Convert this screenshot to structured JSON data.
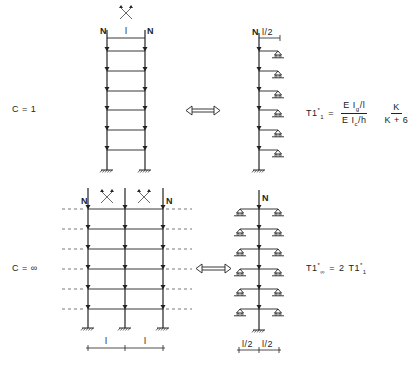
{
  "figure": {
    "top_case": {
      "condition_label": "C = 1",
      "frame_labels": {
        "load_left": "N",
        "load_right": "N",
        "span": "l"
      },
      "substitute_labels": {
        "load": "N",
        "half_span": "l/2"
      },
      "formula": {
        "lhs": "T1",
        "lhs_sup": "*",
        "lhs_sub": "1",
        "equals": "=",
        "frac1_num": "E I",
        "frac1_num_sub": "g",
        "frac1_num_tail": "/l",
        "frac1_den": "E I",
        "frac1_den_sub": "c",
        "frac1_den_tail": "/h",
        "frac2_num": "K",
        "frac2_den": "K + 6"
      },
      "storeys": 6
    },
    "bottom_case": {
      "condition_label": "C = ∞",
      "frame_labels": {
        "load_left": "N",
        "load_right": "N",
        "span_left": "l",
        "span_right": "l"
      },
      "substitute_labels": {
        "load": "N",
        "half_span_left": "l/2",
        "half_span_right": "l/2"
      },
      "formula": {
        "lhs": "T1",
        "lhs_sup": "*",
        "lhs_sub": "∞",
        "equals": "=",
        "rhs_coef": "2",
        "rhs": "T1",
        "rhs_sup": "*",
        "rhs_sub": "1"
      },
      "storeys": 6
    },
    "colors": {
      "ink": "#222222",
      "background": "#ffffff",
      "dashed": "#555555"
    },
    "icons": [
      "sway-cross-icon",
      "equivalence-arrow-icon",
      "fixed-support-icon",
      "roller-support-icon",
      "load-arrow-icon"
    ]
  }
}
